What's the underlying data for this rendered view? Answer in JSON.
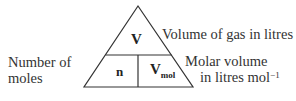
{
  "diagram": {
    "type": "formula-triangle",
    "top_symbol": "V",
    "bottom_left_symbol": "n",
    "bottom_right_symbol_main": "V",
    "bottom_right_symbol_sub": "mol",
    "labels": {
      "top": "Volume of gas in litres",
      "left_line1": "Number of",
      "left_line2": "moles",
      "right_line1": "Molar volume",
      "right_line2": "in litres mol",
      "right_line2_sup": "−1"
    }
  }
}
